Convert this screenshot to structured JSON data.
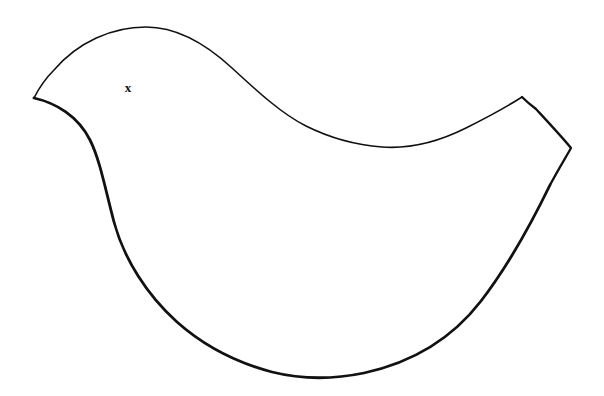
{
  "canvas": {
    "width": 604,
    "height": 396,
    "background_color": "#ffffff",
    "title": "Bird Outline Template"
  },
  "drawing": {
    "name": "bird-silhouette-outline",
    "description": "Hand-drawn closed outline of a stylized bird (dove) facing left, with pointed beak, rounded head and back, swept-up pointed tail at right, and a rounded belly.",
    "stroke_color": "#111111",
    "fill_color": "#ffffff",
    "stroke_width_thin": 1.6,
    "stroke_width_thick": 2.8,
    "outline_path": "M 34 98 L 48 80 C 70 52 108 30 145 27 C 190 24 236 46 268 78 C 300 110 322 128 348 138 C 376 148 402 149 430 143 C 462 136 492 118 522 97 L 536 108 C 548 122 562 136 572 148 C 566 158 556 172 548 186 C 530 222 508 266 482 300 C 452 338 412 362 366 373 C 330 380 302 378 276 372 C 242 364 206 348 178 324 C 146 296 122 260 112 224 C 102 188 98 158 88 138 C 76 116 54 104 34 98 Z",
    "outline_points": [
      {
        "name": "beak-tip",
        "x": 34,
        "y": 98
      },
      {
        "name": "head-top",
        "x": 145,
        "y": 27
      },
      {
        "name": "back-mid",
        "x": 300,
        "y": 115
      },
      {
        "name": "neck-dip-low",
        "x": 400,
        "y": 147
      },
      {
        "name": "tail-top-corner",
        "x": 522,
        "y": 97
      },
      {
        "name": "tail-right-point",
        "x": 572,
        "y": 148
      },
      {
        "name": "body-bottom",
        "x": 300,
        "y": 377
      },
      {
        "name": "breast-left",
        "x": 92,
        "y": 160
      },
      {
        "name": "belly-left",
        "x": 112,
        "y": 235
      }
    ]
  },
  "marks": [
    {
      "name": "eye-x-mark",
      "label": "x",
      "x": 128,
      "y": 88,
      "color": "#111111",
      "font_size": 13
    }
  ]
}
